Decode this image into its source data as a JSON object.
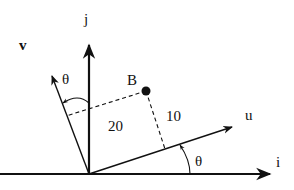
{
  "diagram": {
    "type": "rotated-coordinate-frames",
    "colors": {
      "ink": "#111111",
      "background": "#ffffff"
    },
    "axes": {
      "i": {
        "label": "i"
      },
      "j": {
        "label": "j"
      },
      "u": {
        "label": "u"
      },
      "v": {
        "label": "v"
      }
    },
    "point": {
      "label": "B"
    },
    "projections": {
      "along_u": {
        "label": "20"
      },
      "along_v": {
        "label": "10"
      }
    },
    "angles": {
      "upper": {
        "label": "θ"
      },
      "lower": {
        "label": "θ"
      }
    }
  }
}
